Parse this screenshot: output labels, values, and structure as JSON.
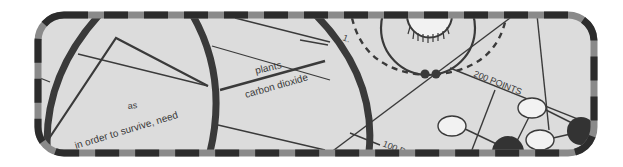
{
  "figure": {
    "kind": "cropped textbook concept-map illustration inside a dashed rounded frame",
    "colors": {
      "background": "#ffffff",
      "panel_fill": "#dcdcdc",
      "border_dark": "#2c2c2c",
      "border_light": "#8a8a8a",
      "line": "#3a3a3a",
      "node_fill": "#f2f2f2"
    },
    "labels": {
      "as": "as",
      "survive": "in order to survive, need",
      "plants": "plants",
      "carbon_dioxide": "carbon dioxide",
      "step_number": "1.",
      "points_200": "200 POINTS",
      "points_100": "100 P"
    },
    "nodes": [
      {
        "label": "(illegible)"
      },
      {
        "label": "(illegible)"
      },
      {
        "label": "(illegible)"
      }
    ]
  }
}
